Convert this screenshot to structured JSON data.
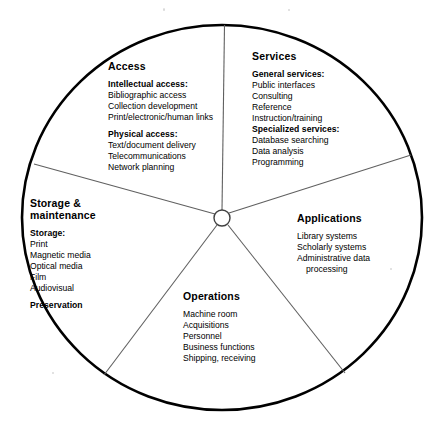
{
  "diagram": {
    "shape": "circle-with-five-sectors",
    "hub_label": "",
    "stroke_color": "#000000",
    "spoke_color": "#555555",
    "background": "#ffffff"
  },
  "sectors": [
    {
      "id": "access",
      "title": "Access",
      "groups": [
        {
          "heading": "Intellectual access:",
          "items": [
            "Bibliographic access",
            "Collection development",
            "Print/electronic/human links"
          ]
        },
        {
          "heading": "Physical access:",
          "items": [
            "Text/document delivery",
            "Telecommunications",
            "Network planning"
          ]
        }
      ]
    },
    {
      "id": "services",
      "title": "Services",
      "groups": [
        {
          "heading": "General services:",
          "items": [
            "Public interfaces",
            "Consulting",
            "Reference",
            "Instruction/training"
          ]
        },
        {
          "heading": "Specialized services:",
          "items": [
            "Database searching",
            "Data analysis",
            "Programming"
          ]
        }
      ]
    },
    {
      "id": "applications",
      "title": "Applications",
      "groups": [
        {
          "heading": "",
          "items": [
            "Library systems",
            "Scholarly systems",
            "Administrative data",
            "processing"
          ]
        }
      ]
    },
    {
      "id": "storage",
      "title": "Storage &\nmaintenance",
      "title_line1": "Storage &",
      "title_line2": "maintenance",
      "groups": [
        {
          "heading": "Storage:",
          "items": [
            "Print",
            "Magnetic media",
            "Optical media",
            "Film",
            "Audiovisual"
          ]
        },
        {
          "heading": "Preservation",
          "items": []
        }
      ]
    },
    {
      "id": "operations",
      "title": "Operations",
      "groups": [
        {
          "heading": "",
          "items": [
            "Machine room",
            "Acquisitions",
            "Personnel",
            "Business functions",
            "Shipping, receiving"
          ]
        }
      ]
    }
  ]
}
